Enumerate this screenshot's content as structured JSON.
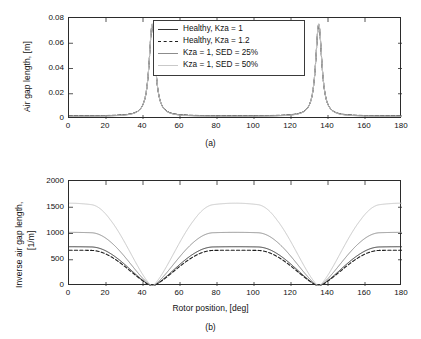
{
  "figure": {
    "panel_a_caption": "(a)",
    "panel_b_caption": "(b)"
  },
  "legend": {
    "entries": [
      {
        "label": "Healthy, Kza = 1",
        "color": "#333333",
        "style": "solid",
        "width": 1.1
      },
      {
        "label": "Healthy, Kza = 1.2",
        "color": "#1f1f1f",
        "style": "dashed",
        "width": 1.2
      },
      {
        "label": "Kza = 1, SED = 25%",
        "color": "#8c8c8c",
        "style": "solid",
        "width": 1.1
      },
      {
        "label": "Kza = 1, SED = 50%",
        "color": "#c9c9c9",
        "style": "solid",
        "width": 1.1
      }
    ]
  },
  "chart_data": [
    {
      "type": "line",
      "panel": "a",
      "title": "",
      "xlabel": "",
      "ylabel": "Air gap length, [m]",
      "xlim": [
        0,
        180
      ],
      "ylim": [
        0,
        0.08
      ],
      "xticks": [
        0,
        20,
        40,
        60,
        80,
        100,
        120,
        140,
        160,
        180
      ],
      "yticks": [
        0,
        0.02,
        0.04,
        0.06,
        0.08
      ],
      "ytick_labels": [
        "0",
        "0.02",
        "0.04",
        "0.06",
        "0.08"
      ],
      "grid": false,
      "legend_position": "top-center",
      "peaks_at_deg": [
        45,
        135
      ],
      "peak_value": 0.075,
      "baseline_value": 0.002,
      "series": [
        {
          "name": "Healthy, Kza = 1",
          "color": "#333333",
          "style": "solid",
          "peak": 0.0748,
          "baseline": 0.0022
        },
        {
          "name": "Healthy, Kza = 1.2",
          "color": "#1f1f1f",
          "style": "dashed",
          "peak": 0.0742,
          "baseline": 0.0024
        },
        {
          "name": "Kza = 1, SED = 25%",
          "color": "#8c8c8c",
          "style": "solid",
          "peak": 0.0752,
          "baseline": 0.0021
        },
        {
          "name": "Kza = 1, SED = 50%",
          "color": "#c9c9c9",
          "style": "solid",
          "peak": 0.0756,
          "baseline": 0.002
        }
      ]
    },
    {
      "type": "line",
      "panel": "b",
      "title": "",
      "xlabel": "Rotor position, [deg]",
      "ylabel": "Inverse air gap length, [1/m]",
      "ylabel_line1": "Inverse air gap length,",
      "ylabel_line2": "[1/m]",
      "xlim": [
        0,
        180
      ],
      "ylim": [
        0,
        2000
      ],
      "xticks": [
        0,
        20,
        40,
        60,
        80,
        100,
        120,
        140,
        160,
        180
      ],
      "yticks": [
        0,
        500,
        1000,
        1500,
        2000
      ],
      "ytick_labels": [
        "0",
        "500",
        "1000",
        "1500",
        "2000"
      ],
      "grid": false,
      "minima_at_deg": [
        45,
        135
      ],
      "x": [
        0,
        10,
        20,
        30,
        40,
        45,
        50,
        60,
        70,
        80,
        90,
        100,
        110,
        120,
        130,
        135,
        140,
        150,
        160,
        170,
        180
      ],
      "series": [
        {
          "name": "Healthy, Kza = 1",
          "color": "#333333",
          "style": "solid",
          "values": [
            720,
            735,
            700,
            560,
            250,
            10,
            250,
            560,
            700,
            735,
            725,
            735,
            700,
            560,
            250,
            10,
            250,
            560,
            700,
            735,
            725
          ]
        },
        {
          "name": "Healthy, Kza = 1.2",
          "color": "#1f1f1f",
          "style": "dashed",
          "values": [
            600,
            640,
            640,
            540,
            245,
            10,
            245,
            540,
            640,
            670,
            660,
            670,
            640,
            540,
            245,
            10,
            245,
            540,
            640,
            660,
            620
          ]
        },
        {
          "name": "Kza = 1, SED = 25%",
          "color": "#8c8c8c",
          "style": "solid",
          "values": [
            970,
            995,
            960,
            760,
            330,
            10,
            330,
            760,
            960,
            1000,
            985,
            1000,
            960,
            760,
            330,
            10,
            330,
            760,
            960,
            1000,
            985
          ]
        },
        {
          "name": "Kza = 1, SED = 50%",
          "color": "#c9c9c9",
          "style": "solid",
          "values": [
            1450,
            1495,
            1450,
            1140,
            480,
            10,
            480,
            1140,
            1450,
            1470,
            1400,
            1470,
            1450,
            1140,
            480,
            10,
            480,
            1140,
            1450,
            1495,
            1450
          ]
        }
      ]
    }
  ]
}
